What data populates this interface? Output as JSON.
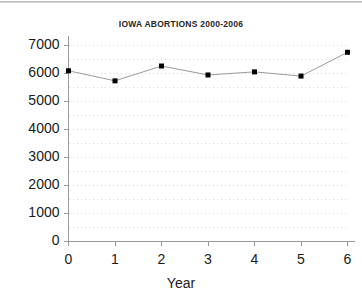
{
  "chart_data": {
    "type": "line",
    "title": "IOWA ABORTIONS 2000-2006",
    "xlabel": "Year",
    "ylabel": "",
    "x": [
      0,
      1,
      2,
      3,
      4,
      5,
      6
    ],
    "categories": [
      "0",
      "1",
      "2",
      "3",
      "4",
      "5",
      "6"
    ],
    "values": [
      6080,
      5720,
      6250,
      5930,
      6040,
      5890,
      6740
    ],
    "series": [
      {
        "name": "Abortions",
        "values": [
          6080,
          5720,
          6250,
          5930,
          6040,
          5890,
          6740
        ]
      }
    ],
    "xlim": [
      0,
      6
    ],
    "ylim": [
      0,
      7000
    ],
    "ytick_labels": [
      "7000",
      "6000",
      "5000",
      "4000",
      "3000",
      "2000",
      "1000",
      "0"
    ],
    "ytick_values": [
      7000,
      6000,
      5000,
      4000,
      3000,
      2000,
      1000,
      0
    ],
    "xtick_labels": [
      "0",
      "1",
      "2",
      "3",
      "4",
      "5",
      "6"
    ],
    "grid": true,
    "grid_style": "dotted",
    "grid_interval": 500,
    "legend": false,
    "marker": "square",
    "colors": {
      "line": "#9a9a9a",
      "marker": "#000000",
      "axis": "#9a9a9a",
      "grid": "#e2d8d8",
      "text": "#1a1a1a",
      "background": "#ffffff"
    }
  },
  "axes": {
    "y_ticks": [
      {
        "label": "7000",
        "value": 7000
      },
      {
        "label": "6000",
        "value": 6000
      },
      {
        "label": "5000",
        "value": 5000
      },
      {
        "label": "4000",
        "value": 4000
      },
      {
        "label": "3000",
        "value": 3000
      },
      {
        "label": "2000",
        "value": 2000
      },
      {
        "label": "1000",
        "value": 1000
      },
      {
        "label": "0",
        "value": 0
      }
    ],
    "x_ticks": [
      {
        "label": "0",
        "value": 0
      },
      {
        "label": "1",
        "value": 1
      },
      {
        "label": "2",
        "value": 2
      },
      {
        "label": "3",
        "value": 3
      },
      {
        "label": "4",
        "value": 4
      },
      {
        "label": "5",
        "value": 5
      },
      {
        "label": "6",
        "value": 6
      }
    ],
    "x_title": "Year"
  }
}
